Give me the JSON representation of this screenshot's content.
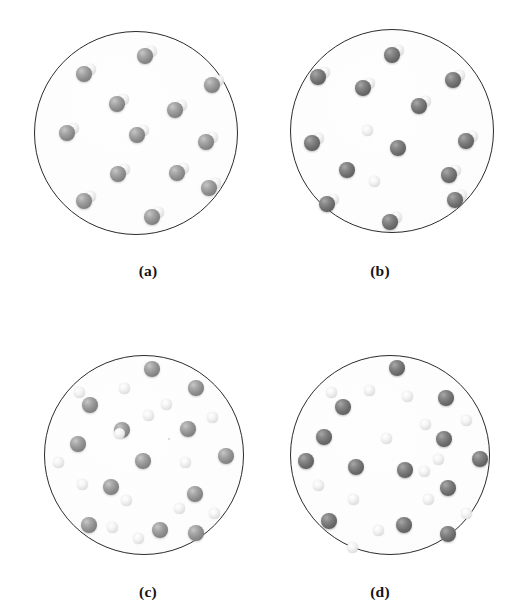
{
  "figure": {
    "kind": "scientific-figure",
    "background_color": "#ffffff",
    "outline_color": "#2b2b2b",
    "atom_colors": {
      "heavy_medium": "#8d8d8d",
      "heavy_dark": "#6e6e6e",
      "light": "#f2f2f2"
    },
    "panel_count": 4
  },
  "panels": [
    {
      "id": "a",
      "label": "(a)",
      "label_x": 148,
      "label_y": 262,
      "circle": {
        "cx": 136,
        "cy": 133,
        "r": 102
      },
      "shade": "shade-mid",
      "state": "intact-molecules",
      "molecule_count": 13,
      "free_light_count": 0,
      "free_heavy_count": 0,
      "molecules": [
        {
          "x": 145,
          "y": 56
        },
        {
          "x": 84,
          "y": 74
        },
        {
          "x": 212,
          "y": 85
        },
        {
          "x": 117,
          "y": 104
        },
        {
          "x": 175,
          "y": 110
        },
        {
          "x": 67,
          "y": 133
        },
        {
          "x": 137,
          "y": 135
        },
        {
          "x": 206,
          "y": 142
        },
        {
          "x": 118,
          "y": 174
        },
        {
          "x": 177,
          "y": 173
        },
        {
          "x": 209,
          "y": 188
        },
        {
          "x": 84,
          "y": 201
        },
        {
          "x": 152,
          "y": 217
        }
      ],
      "free_light": [],
      "free_heavy": []
    },
    {
      "id": "b",
      "label": "(b)",
      "label_x": 380,
      "label_y": 262,
      "circle": {
        "cx": 392,
        "cy": 131,
        "r": 102
      },
      "shade": "shade-dark",
      "state": "partially-dissociated",
      "molecule_count": 11,
      "free_light_count": 2,
      "free_heavy_count": 2,
      "molecules": [
        {
          "x": 392,
          "y": 55
        },
        {
          "x": 318,
          "y": 77
        },
        {
          "x": 453,
          "y": 80
        },
        {
          "x": 363,
          "y": 88
        },
        {
          "x": 312,
          "y": 143
        },
        {
          "x": 466,
          "y": 141
        },
        {
          "x": 449,
          "y": 175
        },
        {
          "x": 327,
          "y": 204
        },
        {
          "x": 455,
          "y": 200
        },
        {
          "x": 390,
          "y": 222
        },
        {
          "x": 419,
          "y": 106
        }
      ],
      "free_light": [
        {
          "x": 367,
          "y": 130
        },
        {
          "x": 374,
          "y": 181
        }
      ],
      "free_heavy": [
        {
          "x": 398,
          "y": 148
        },
        {
          "x": 347,
          "y": 170
        }
      ]
    },
    {
      "id": "c",
      "label": "(c)",
      "label_x": 148,
      "label_y": 583,
      "circle": {
        "cx": 144,
        "cy": 455,
        "r": 100
      },
      "shade": "shade-mid",
      "state": "fully-dissociated",
      "molecule_count": 0,
      "free_light_count": 14,
      "free_heavy_count": 13,
      "molecules": [],
      "free_heavy": [
        {
          "x": 152,
          "y": 369
        },
        {
          "x": 196,
          "y": 388
        },
        {
          "x": 90,
          "y": 405
        },
        {
          "x": 122,
          "y": 430
        },
        {
          "x": 188,
          "y": 429
        },
        {
          "x": 78,
          "y": 444
        },
        {
          "x": 226,
          "y": 456
        },
        {
          "x": 143,
          "y": 461
        },
        {
          "x": 111,
          "y": 487
        },
        {
          "x": 195,
          "y": 494
        },
        {
          "x": 89,
          "y": 525
        },
        {
          "x": 160,
          "y": 530
        },
        {
          "x": 196,
          "y": 533
        }
      ],
      "free_light": [
        {
          "x": 79,
          "y": 392
        },
        {
          "x": 124,
          "y": 388
        },
        {
          "x": 148,
          "y": 415
        },
        {
          "x": 212,
          "y": 417
        },
        {
          "x": 119,
          "y": 433
        },
        {
          "x": 185,
          "y": 462
        },
        {
          "x": 82,
          "y": 484
        },
        {
          "x": 126,
          "y": 500
        },
        {
          "x": 179,
          "y": 508
        },
        {
          "x": 214,
          "y": 513
        },
        {
          "x": 112,
          "y": 527
        },
        {
          "x": 138,
          "y": 538
        },
        {
          "x": 58,
          "y": 462
        },
        {
          "x": 166,
          "y": 404
        }
      ],
      "speck": {
        "x": 168,
        "y": 438
      }
    },
    {
      "id": "d",
      "label": "(d)",
      "label_x": 380,
      "label_y": 583,
      "circle": {
        "cx": 390,
        "cy": 455,
        "r": 100
      },
      "shade": "shade-dark",
      "state": "fully-dissociated",
      "molecule_count": 0,
      "free_light_count": 14,
      "free_heavy_count": 13,
      "molecules": [],
      "free_heavy": [
        {
          "x": 397,
          "y": 368
        },
        {
          "x": 343,
          "y": 407
        },
        {
          "x": 446,
          "y": 398
        },
        {
          "x": 324,
          "y": 437
        },
        {
          "x": 444,
          "y": 439
        },
        {
          "x": 306,
          "y": 461
        },
        {
          "x": 356,
          "y": 467
        },
        {
          "x": 405,
          "y": 470
        },
        {
          "x": 480,
          "y": 459
        },
        {
          "x": 448,
          "y": 488
        },
        {
          "x": 329,
          "y": 521
        },
        {
          "x": 404,
          "y": 525
        },
        {
          "x": 448,
          "y": 534
        }
      ],
      "free_light": [
        {
          "x": 331,
          "y": 392
        },
        {
          "x": 369,
          "y": 390
        },
        {
          "x": 407,
          "y": 396
        },
        {
          "x": 425,
          "y": 424
        },
        {
          "x": 466,
          "y": 420
        },
        {
          "x": 386,
          "y": 438
        },
        {
          "x": 438,
          "y": 459
        },
        {
          "x": 318,
          "y": 485
        },
        {
          "x": 353,
          "y": 499
        },
        {
          "x": 428,
          "y": 499
        },
        {
          "x": 466,
          "y": 513
        },
        {
          "x": 378,
          "y": 530
        },
        {
          "x": 352,
          "y": 547
        },
        {
          "x": 424,
          "y": 471
        }
      ]
    }
  ]
}
